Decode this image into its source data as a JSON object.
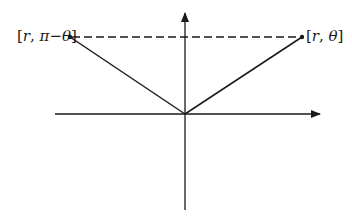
{
  "diagram": {
    "type": "polar-coordinate-symmetry",
    "points": [
      {
        "id": "left",
        "label_open": "[",
        "label_r": "r",
        "label_sep": ", ",
        "label_angle": "π−θ",
        "label_close": "]",
        "x": 70,
        "y": 37
      },
      {
        "id": "right",
        "label_open": "[",
        "label_r": "r",
        "label_sep": ", ",
        "label_angle": "θ",
        "label_close": "]",
        "x": 302,
        "y": 37
      }
    ],
    "origin": {
      "x": 185,
      "y": 114
    },
    "axes": {
      "horizontal": {
        "x1": 55,
        "x2": 320,
        "y": 114,
        "arrow": "right"
      },
      "vertical": {
        "x": 185,
        "y1": 210,
        "y2": 13,
        "arrow": "up"
      }
    },
    "dashed_line": {
      "x1": 70,
      "x2": 302,
      "y": 37
    },
    "colors": {
      "line": "#1a1a1a",
      "background": "#ffffff"
    }
  }
}
